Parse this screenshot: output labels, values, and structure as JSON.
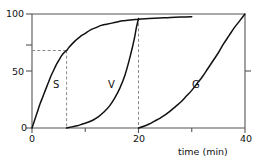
{
  "chart_data": {
    "type": "line",
    "title": "",
    "xlabel": "time (min)",
    "ylabel": "",
    "xlim": [
      0,
      40
    ],
    "ylim": [
      0,
      100
    ],
    "grid": false,
    "legend": "inline-curve-labels",
    "xticks": [
      0,
      20,
      40
    ],
    "xticklabels": [
      "0",
      "20",
      "40"
    ],
    "xminorticks": [
      10,
      30
    ],
    "yticks": [
      0,
      50,
      100
    ],
    "yticklabels": [
      "0",
      "50",
      "100"
    ],
    "yminorticks": [
      68
    ],
    "annotations": {
      "dashed_horizontal_value": 68,
      "dashed_vertical_values": [
        6.5,
        20
      ],
      "dashed_style": "dashed",
      "description": "Dashed guide from y=68 to the S curve at t=6.5; dashed verticals at t=6.5 and t=20"
    },
    "series": [
      {
        "name": "S",
        "label": "S",
        "label_x": 4.2,
        "label_y": 40,
        "x": [
          0,
          0.5,
          1,
          1.5,
          2,
          2.5,
          3,
          3.5,
          4,
          4.5,
          5,
          5.5,
          6,
          6.5,
          7,
          8,
          9,
          10,
          11,
          12,
          13,
          14,
          15,
          16,
          17,
          18,
          19,
          20,
          22,
          24,
          26,
          28,
          30
        ],
        "y": [
          0,
          7,
          14,
          21,
          27,
          33,
          39,
          45,
          50,
          55,
          59,
          63,
          66,
          68,
          71,
          76,
          80,
          83,
          86,
          88,
          90,
          91,
          92,
          93,
          94,
          94.5,
          95,
          95.5,
          96,
          96.5,
          97,
          97.3,
          97.5
        ]
      },
      {
        "name": "V",
        "label": "V",
        "label_x": 14.5,
        "label_y": 40,
        "x": [
          6.5,
          7.5,
          8.5,
          9.5,
          10.5,
          11.5,
          12.5,
          13.5,
          14.5,
          15.5,
          16.5,
          17.5,
          18.5,
          19.2,
          19.6,
          20
        ],
        "y": [
          0,
          1,
          2,
          3.5,
          5,
          7,
          10,
          14,
          19,
          26,
          35,
          47,
          64,
          78,
          88,
          96
        ]
      },
      {
        "name": "G",
        "label": "G",
        "label_x": 30.5,
        "label_y": 40,
        "x": [
          20,
          21,
          22,
          23,
          24,
          25,
          26,
          27,
          28,
          29,
          30,
          31,
          32,
          33,
          34,
          35,
          36,
          37,
          38,
          39,
          40
        ],
        "y": [
          0,
          1.5,
          3.5,
          6,
          8.5,
          11.5,
          15,
          19,
          23,
          28,
          33,
          39,
          45,
          52,
          59,
          66,
          74,
          81,
          88,
          94,
          100
        ]
      }
    ],
    "colors": {
      "curve": "#111111",
      "axis": "#555555",
      "dashed": "#888888",
      "background": "#ffffff"
    }
  },
  "labels": {
    "y_100": "100",
    "y_50": "50",
    "y_0": "0",
    "x_0": "0",
    "x_20": "20",
    "x_40": "40",
    "x_axis_title": "time (min)",
    "curve_s": "S",
    "curve_v": "V",
    "curve_g": "G"
  }
}
